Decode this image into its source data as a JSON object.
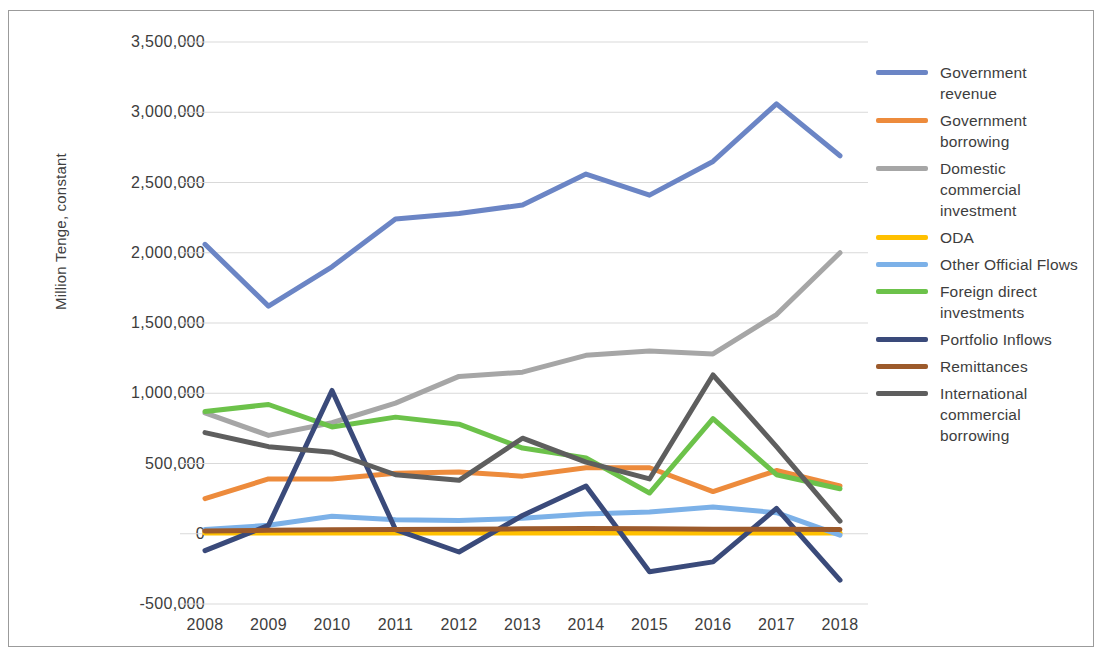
{
  "chart_data": {
    "type": "line",
    "title": "",
    "xlabel": "",
    "ylabel": "Million Tenge, constant",
    "categories": [
      "2008",
      "2009",
      "2010",
      "2011",
      "2012",
      "2013",
      "2014",
      "2015",
      "2016",
      "2017",
      "2018"
    ],
    "x": [
      2008,
      2009,
      2010,
      2011,
      2012,
      2013,
      2014,
      2015,
      2016,
      2017,
      2018
    ],
    "ylim": [
      -500000,
      3500000
    ],
    "ytick_labels": [
      "3,500,000",
      "3,000,000",
      "2,500,000",
      "2,000,000",
      "1,500,000",
      "1,000,000",
      "500,000",
      "0",
      "-500,000"
    ],
    "ytick_values": [
      3500000,
      3000000,
      2500000,
      2000000,
      1500000,
      1000000,
      500000,
      0,
      -500000
    ],
    "grid": true,
    "grid_axis": "y",
    "legend_position": "right",
    "series": [
      {
        "name": "Government revenue",
        "color": "#6b85c5",
        "values": [
          2060000,
          1620000,
          1900000,
          2240000,
          2280000,
          2340000,
          2560000,
          2410000,
          2650000,
          3060000,
          2690000
        ]
      },
      {
        "name": "Government borrowing",
        "color": "#ed8b3c",
        "values": [
          250000,
          390000,
          390000,
          430000,
          440000,
          410000,
          470000,
          470000,
          300000,
          450000,
          340000
        ]
      },
      {
        "name": "Domestic commercial investment",
        "color": "#a6a6a6",
        "values": [
          860000,
          700000,
          790000,
          930000,
          1120000,
          1150000,
          1270000,
          1300000,
          1280000,
          1560000,
          2000000
        ]
      },
      {
        "name": "ODA",
        "color": "#ffc000",
        "values": [
          5000,
          5000,
          5000,
          5000,
          5000,
          5000,
          5000,
          5000,
          5000,
          5000,
          5000
        ]
      },
      {
        "name": "Other Official Flows",
        "color": "#7cb1e8",
        "values": [
          30000,
          60000,
          125000,
          100000,
          95000,
          110000,
          140000,
          155000,
          190000,
          150000,
          -10000
        ]
      },
      {
        "name": "Foreign direct investments",
        "color": "#6cc24a",
        "values": [
          870000,
          920000,
          760000,
          830000,
          780000,
          610000,
          540000,
          290000,
          820000,
          420000,
          320000
        ]
      },
      {
        "name": "Portfolio Inflows",
        "color": "#3a4a7a",
        "values": [
          -120000,
          60000,
          1020000,
          30000,
          -130000,
          130000,
          340000,
          -270000,
          -200000,
          180000,
          -330000
        ]
      },
      {
        "name": "Remittances",
        "color": "#9c5a2b",
        "values": [
          20000,
          25000,
          28000,
          30000,
          32000,
          35000,
          38000,
          35000,
          32000,
          32000,
          30000
        ]
      },
      {
        "name": "International commercial borrowing",
        "color": "#5e5e5e",
        "values": [
          720000,
          620000,
          580000,
          420000,
          380000,
          680000,
          510000,
          390000,
          1130000,
          620000,
          90000
        ]
      }
    ]
  },
  "legend": {
    "items": [
      {
        "label": "Government revenue",
        "color": "#6b85c5"
      },
      {
        "label": "Government borrowing",
        "color": "#ed8b3c"
      },
      {
        "label": "Domestic commercial investment",
        "color": "#a6a6a6"
      },
      {
        "label": "ODA",
        "color": "#ffc000"
      },
      {
        "label": "Other Official Flows",
        "color": "#7cb1e8"
      },
      {
        "label": "Foreign direct investments",
        "color": "#6cc24a"
      },
      {
        "label": "Portfolio Inflows",
        "color": "#3a4a7a"
      },
      {
        "label": "Remittances",
        "color": "#9c5a2b"
      },
      {
        "label": "International commercial borrowing",
        "color": "#5e5e5e"
      }
    ]
  }
}
